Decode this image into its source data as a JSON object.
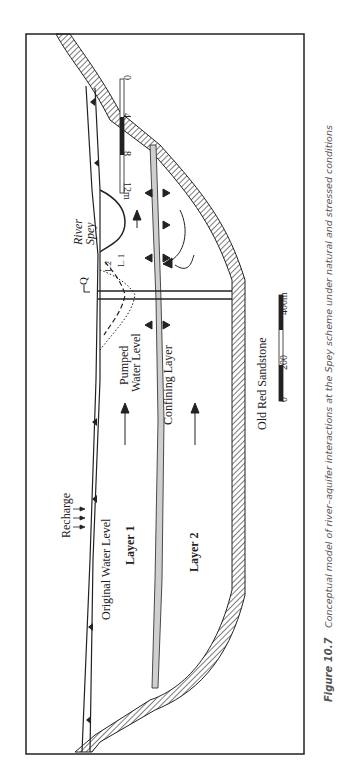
{
  "figure": {
    "number_label": "Figure 10.7",
    "caption": "Conceptual model of river–aquifer interactions at the Spey scheme under natural and stressed conditions"
  },
  "labels": {
    "recharge": "Recharge",
    "original_water_level": "Original Water Level",
    "layer1": "Layer 1",
    "layer2": "Layer 2",
    "pumped_water_level_1": "Pumped",
    "pumped_water_level_2": "Water Level",
    "confining_layer": "Confining Layer",
    "bedrock": "Old Red Sandstone",
    "river_1": "River",
    "river_2": "Spey",
    "pumping": "Q",
    "l1": "L. 1",
    "l2": "L.2"
  },
  "vertical_scale": {
    "ticks": [
      "0",
      "4",
      "8",
      "12m"
    ]
  },
  "horizontal_scale": {
    "ticks": [
      "0",
      "200",
      "400m"
    ]
  },
  "colors": {
    "line": "#222222",
    "confining_fill": "#cfcfcf",
    "caption": "#555555"
  }
}
